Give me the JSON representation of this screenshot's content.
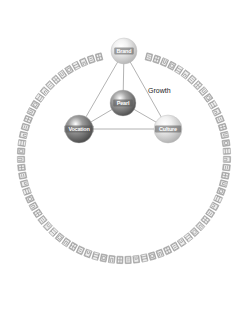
{
  "diagram": {
    "ring": {
      "center": [
        124,
        157
      ],
      "radius": 103,
      "tile_count": 74,
      "tile_color": "#9a9a9a",
      "gap_at_top_degrees": 14
    },
    "nodes": [
      {
        "id": "brand",
        "label": "Brand",
        "x": 124,
        "y": 51,
        "r": 13,
        "fill_light": "#f2f2f2",
        "fill_dark": "#b5b5b5",
        "text_color": "#333333"
      },
      {
        "id": "pearl",
        "label": "Pearl",
        "x": 123,
        "y": 103,
        "r": 13,
        "fill_light": "#a8a8a8",
        "fill_dark": "#4e4e4e",
        "text_color": "#ffffff"
      },
      {
        "id": "vocation",
        "label": "Vocation",
        "x": 79,
        "y": 129,
        "r": 14,
        "fill_light": "#9c9c9c",
        "fill_dark": "#4a4a4a",
        "text_color": "#ffffff"
      },
      {
        "id": "culture",
        "label": "Culture",
        "x": 168,
        "y": 129,
        "r": 14,
        "fill_light": "#f0f0f0",
        "fill_dark": "#b0b0b0",
        "text_color": "#333333"
      }
    ],
    "edges": [
      {
        "from": "brand",
        "to": "vocation"
      },
      {
        "from": "brand",
        "to": "culture"
      },
      {
        "from": "brand",
        "to": "pearl"
      },
      {
        "from": "pearl",
        "to": "vocation"
      },
      {
        "from": "pearl",
        "to": "culture"
      },
      {
        "from": "vocation",
        "to": "culture"
      }
    ],
    "edge_color": "#a0a0a0",
    "labels": [
      {
        "text": "Growth",
        "x": 148,
        "y": 93
      }
    ]
  }
}
